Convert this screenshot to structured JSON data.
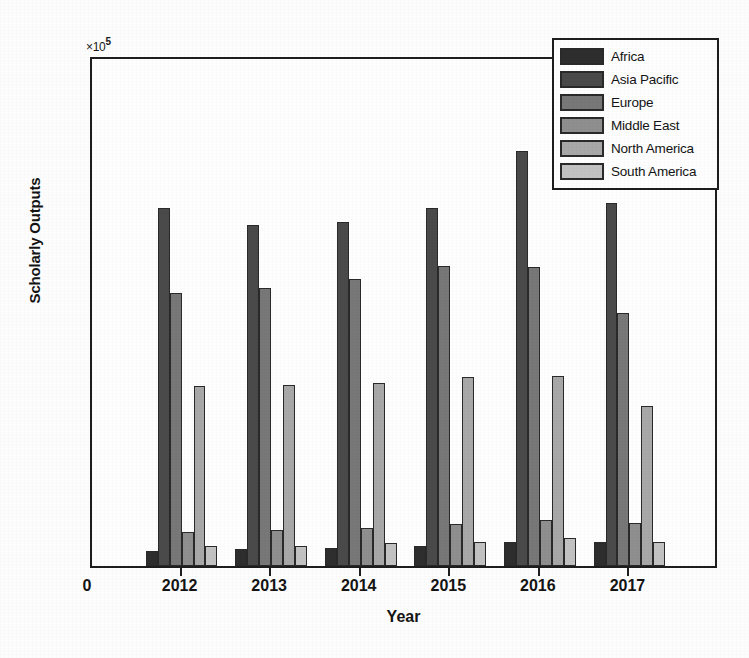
{
  "chart_data": {
    "type": "bar",
    "title": "",
    "subtitle": "",
    "xlabel": "Year",
    "ylabel": "Scholarly Outputs",
    "y_exponent_label": "×10",
    "y_exponent_power": "5",
    "y_axis_multiplier": 100000,
    "categories": [
      "2012",
      "2013",
      "2014",
      "2015",
      "2016",
      "2017"
    ],
    "ylim": [
      0,
      2
    ],
    "yticks": [
      "0",
      "0.2",
      "0.4",
      "0.6",
      "0.8",
      "1",
      "1.2",
      "1.4",
      "1.6",
      "1.8",
      "2"
    ],
    "ytick_values": [
      0,
      0.2,
      0.4,
      0.6,
      0.8,
      1,
      1.2,
      1.4,
      1.6,
      1.8,
      2
    ],
    "xtick_origin_label": "0",
    "grid": false,
    "legend_position": "top-right",
    "bar_edge_color": "#2a2a2a",
    "series": [
      {
        "name": "Africa",
        "color": "#2e2e2e",
        "values": [
          0.06,
          0.065,
          0.07,
          0.08,
          0.095,
          0.095
        ]
      },
      {
        "name": "Asia Pacific",
        "color": "#4a4a4a",
        "values": [
          1.4,
          1.335,
          1.345,
          1.4,
          1.625,
          1.42
        ]
      },
      {
        "name": "Europe",
        "color": "#787878",
        "values": [
          1.07,
          1.09,
          1.125,
          1.175,
          1.17,
          0.99
        ]
      },
      {
        "name": "Middle East",
        "color": "#8f8f8f",
        "values": [
          0.135,
          0.14,
          0.15,
          0.165,
          0.18,
          0.17
        ]
      },
      {
        "name": "North America",
        "color": "#a8a8a8",
        "values": [
          0.705,
          0.71,
          0.715,
          0.74,
          0.745,
          0.625
        ]
      },
      {
        "name": "South America",
        "color": "#c2c2c2",
        "values": [
          0.08,
          0.08,
          0.09,
          0.095,
          0.11,
          0.095
        ]
      }
    ]
  }
}
